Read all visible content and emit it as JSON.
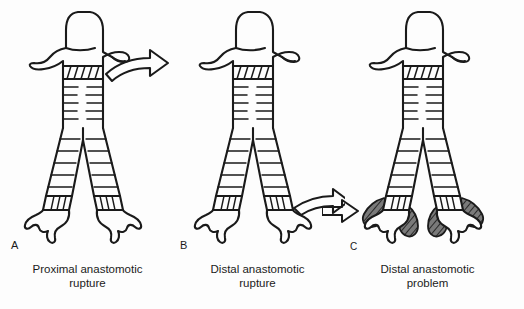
{
  "figure": {
    "background_color": "#fdfdfd",
    "ink_color": "#1a1a1a",
    "shading_color": "#555555",
    "bottom_note_text": ""
  },
  "panels": [
    {
      "letter": "A",
      "caption_line1": "Proximal anastomotic",
      "caption_line2": "rupture",
      "arrow": "curved-arrow-right",
      "arrow_target": "proximal-anastomosis",
      "has_shading": false
    },
    {
      "letter": "B",
      "caption_line1": "Distal anastomotic",
      "caption_line2": "rupture",
      "arrow": "curved-arrow-right",
      "arrow_target": "distal-anastomosis",
      "has_shading": false
    },
    {
      "letter": "C",
      "caption_line1": "Distal anastomotic",
      "caption_line2": "problem",
      "arrow": "arrow-right",
      "arrow_target": "distal-anastomosis",
      "has_shading": true
    }
  ],
  "anatomy": {
    "larynx_label": "larynx",
    "trachea_label": "trachea",
    "carina_label": "carina",
    "left_bronchus_label": "left main bronchus",
    "right_bronchus_label": "right main bronchus",
    "proximal_anastomosis_label": "proximal anastomosis",
    "distal_anastomosis_label": "distal anastomosis",
    "granulation_label": "granulation tissue"
  }
}
